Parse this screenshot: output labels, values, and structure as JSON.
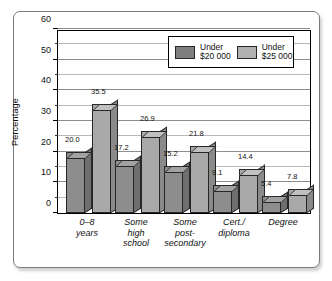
{
  "chart_data": {
    "type": "bar",
    "title": "",
    "xlabel": "",
    "ylabel": "Percentage",
    "ylim": [
      0,
      60
    ],
    "ytick_labels": [
      "0",
      "10",
      "20",
      "30",
      "40",
      "50",
      "60"
    ],
    "ytick_values": [
      0,
      10,
      20,
      30,
      40,
      50,
      60
    ],
    "minor_tick_interval": 5,
    "grid": true,
    "grid_orientation": "horizontal",
    "legend_position": "top-right-inside",
    "categories": [
      "0–8\nyears",
      "Some\nhigh\nschool",
      "Some\npost-\nsecondary",
      "Cert./\ndiploma",
      "Degree"
    ],
    "series": [
      {
        "name": "Under\n$20 000",
        "color": "#8d8d8d",
        "values": [
          20.0,
          17.2,
          15.2,
          9.1,
          5.4
        ],
        "value_labels": [
          "20.0",
          "17.2",
          "15.2",
          "9.1",
          "5.4"
        ]
      },
      {
        "name": "Under\n$25 000",
        "color": "#a9a9a9",
        "values": [
          35.5,
          26.9,
          21.8,
          14.4,
          7.8
        ],
        "value_labels": [
          "35.5",
          "26.9",
          "21.8",
          "14.4",
          "7.8"
        ]
      }
    ]
  },
  "legend": {
    "items": [
      {
        "label": "Under\n$20 000",
        "swatch": "#7f7f7f"
      },
      {
        "label": "Under\n$25 000",
        "swatch": "#b0b0b0"
      }
    ]
  }
}
